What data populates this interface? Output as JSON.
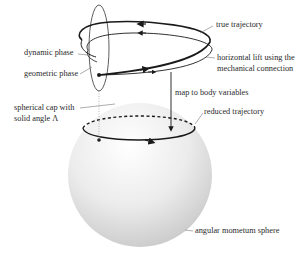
{
  "diagram": {
    "labels": {
      "true_trajectory": "true trajectory",
      "horizontal_lift_1": "horizontal lift using the",
      "horizontal_lift_2": "mechanical connection",
      "dynamic_phase": "dynamic phase",
      "geometric_phase": "geometric phase",
      "map_to_body": "map to body variables",
      "spherical_cap_1": "spherical cap with",
      "spherical_cap_2": "solid angle Λ",
      "reduced_trajectory": "reduced trajectory",
      "angular_momentum_sphere": "angular mometum sphere"
    },
    "colors": {
      "line": "#1a1a1a",
      "leader": "#777777",
      "sphere_light": "#fbfbfb",
      "sphere_dark": "#cfcfcf"
    }
  }
}
